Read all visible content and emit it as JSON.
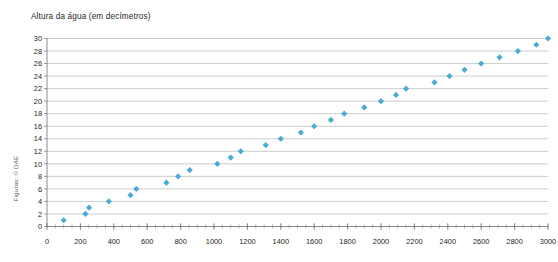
{
  "chart_data": {
    "type": "scatter",
    "title": "Altura da água (em decímetros)",
    "xlabel": "",
    "ylabel": "",
    "xlim": [
      0,
      3000
    ],
    "ylim": [
      0,
      30
    ],
    "grid": true,
    "legend": "none",
    "marker": "diamond",
    "marker_color": "#4caad6",
    "xticks": [
      0,
      200,
      400,
      600,
      800,
      1000,
      1200,
      1400,
      1600,
      1800,
      2000,
      2200,
      2400,
      2600,
      2800,
      3000
    ],
    "xtick_labels": [
      "0",
      "200",
      "400",
      "600",
      "800",
      "1000",
      "1200",
      "1400",
      "1600",
      "1800",
      "2000",
      "2200",
      "2400",
      "2600",
      "2800",
      "3000"
    ],
    "x_minor_step": 50,
    "yticks": [
      0,
      2,
      4,
      6,
      8,
      10,
      12,
      14,
      16,
      18,
      20,
      22,
      24,
      26,
      28,
      30
    ],
    "ytick_labels": [
      "0",
      "2",
      "4",
      "6",
      "8",
      "10",
      "12",
      "14",
      "16",
      "18",
      "20",
      "22",
      "24",
      "26",
      "28",
      "30"
    ],
    "series": [
      {
        "name": "Altura da água",
        "points": [
          [
            100,
            1
          ],
          [
            230,
            2
          ],
          [
            252,
            3
          ],
          [
            370,
            4
          ],
          [
            500,
            5
          ],
          [
            535,
            6
          ],
          [
            715,
            7
          ],
          [
            785,
            8
          ],
          [
            855,
            9
          ],
          [
            1020,
            10
          ],
          [
            1100,
            11
          ],
          [
            1160,
            12
          ],
          [
            1310,
            13
          ],
          [
            1400,
            14
          ],
          [
            1520,
            15
          ],
          [
            1600,
            16
          ],
          [
            1700,
            17
          ],
          [
            1780,
            18
          ],
          [
            1900,
            19
          ],
          [
            2000,
            20
          ],
          [
            2090,
            21
          ],
          [
            2150,
            22
          ],
          [
            2320,
            23
          ],
          [
            2410,
            24
          ],
          [
            2500,
            25
          ],
          [
            2600,
            26
          ],
          [
            2710,
            27
          ],
          [
            2820,
            28
          ],
          [
            2930,
            29
          ],
          [
            3000,
            30
          ]
        ]
      }
    ]
  },
  "credit": {
    "text": "Figuras: © DAE"
  }
}
